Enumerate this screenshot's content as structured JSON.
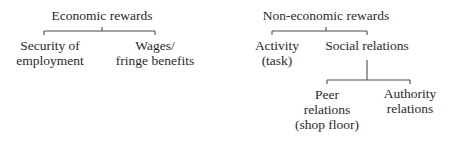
{
  "diagram": {
    "type": "tree",
    "trees": [
      {
        "root": {
          "label": "Economic rewards"
        },
        "children": [
          {
            "lines": [
              "Security of",
              "employment"
            ]
          },
          {
            "lines": [
              "Wages/",
              "fringe benefits"
            ]
          }
        ]
      },
      {
        "root": {
          "label": "Non-economic rewards"
        },
        "children": [
          {
            "lines": [
              "Activity",
              "(task)"
            ]
          },
          {
            "lines": [
              "Social relations"
            ],
            "children": [
              {
                "lines": [
                  "Peer",
                  "relations",
                  "(shop floor)"
                ]
              },
              {
                "lines": [
                  "Authority",
                  "relations"
                ]
              }
            ]
          }
        ]
      }
    ],
    "line_color": "#4a4a4a",
    "text_color": "#2a2a2a",
    "background": "#ffffff"
  }
}
